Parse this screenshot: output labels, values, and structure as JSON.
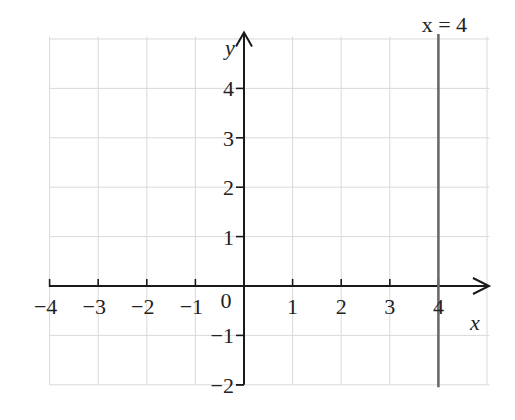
{
  "chart_data": {
    "type": "line",
    "title": "",
    "xlabel": "x",
    "ylabel": "y",
    "xlim": [
      -4,
      5
    ],
    "ylim": [
      -2,
      4.6
    ],
    "grid": true,
    "x_ticks": [
      -4,
      -3,
      -2,
      -1,
      1,
      2,
      3,
      4
    ],
    "x_tick_labels": [
      "−4",
      "−3",
      "−2",
      "−1",
      "1",
      "2",
      "3",
      "4"
    ],
    "y_ticks": [
      4,
      3,
      2,
      1,
      -1,
      -2
    ],
    "y_tick_labels": [
      "4",
      "3",
      "2",
      "1",
      "−1",
      "−2"
    ],
    "origin_label": "0",
    "series": [
      {
        "name": "x = 4",
        "kind": "vertical_line",
        "x": [
          4,
          4
        ],
        "y": [
          -2,
          4.6
        ],
        "color": "#6b6b6b"
      }
    ],
    "annotations": [
      {
        "text": "x = 4",
        "x": 4,
        "y": 4.7
      }
    ]
  },
  "labels": {
    "x_axis": "x",
    "y_axis": "y",
    "origin": "0",
    "line_label": "x = 4"
  },
  "colors": {
    "axis": "#1a1a1a",
    "grid": "#d9d9d9",
    "line": "#6b6b6b",
    "background": "#ffffff"
  }
}
